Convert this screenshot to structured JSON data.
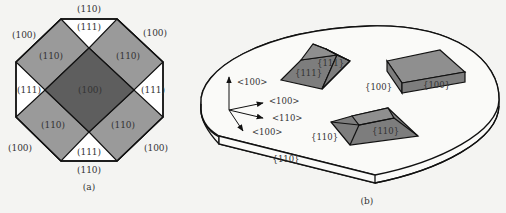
{
  "panel_a": {
    "caption": "(a)",
    "labels": {
      "top_edge": "(110)",
      "top_tri": "(111)",
      "top_left_corner": "(100)",
      "top_right_corner": "(100)",
      "upper_left_face": "(110)",
      "upper_right_face": "(110)",
      "left_tri": "(111)",
      "right_tri": "(111)",
      "center": "(100)",
      "lower_left_face": "(110)",
      "lower_right_face": "(110)",
      "bottom_left_corner": "(100)",
      "bottom_right_corner": "(100)",
      "bottom_tri": "(111)",
      "bottom_edge": "(110)"
    },
    "colors": {
      "center": "#5e5e5e",
      "faces": "#9a9a9a",
      "triangles": "#ffffff",
      "stroke": "#111111"
    }
  },
  "panel_b": {
    "caption": "(b)",
    "axes": {
      "up": "<100>",
      "right": "<100>",
      "diag": "<110>",
      "down": "<100>"
    },
    "shapes": {
      "pyramid": {
        "front_face": "{111}",
        "side_face": "{111}"
      },
      "box": {
        "side_label": "{100}",
        "front_face": "{100}"
      },
      "ridge": {
        "side_label": "{110}",
        "front_face": "{110}"
      }
    },
    "wafer_flat": "{110}",
    "colors": {
      "shape_fill": "#7d7d7d",
      "shape_top": "#8f8f8f",
      "wafer_fill": "#fafaf8",
      "stroke": "#111111"
    }
  }
}
